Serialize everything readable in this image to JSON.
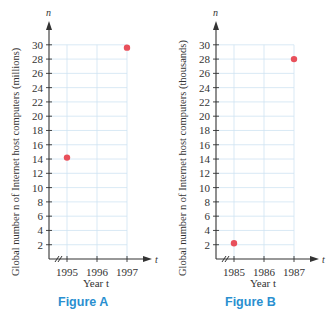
{
  "chart_data": [
    {
      "type": "scatter",
      "title": "Figure A",
      "xlabel": "Year t",
      "ylabel": "Global number n of Internet host computers (millions)",
      "x_axis_symbol": "t",
      "y_axis_symbol": "n",
      "x_ticks": [
        "1995",
        "1996",
        "1997"
      ],
      "y_ticks": [
        2,
        4,
        6,
        8,
        10,
        12,
        14,
        16,
        18,
        20,
        22,
        24,
        26,
        28,
        30
      ],
      "xlim": [
        1994.4,
        1997.5
      ],
      "ylim": [
        0,
        31
      ],
      "axis_break": true,
      "grid": true,
      "points": [
        {
          "x": 1995,
          "y": 14.2
        },
        {
          "x": 1997,
          "y": 29.6
        }
      ],
      "point_color": "#e8505b"
    },
    {
      "type": "scatter",
      "title": "Figure B",
      "xlabel": "Year t",
      "ylabel": "Global number n of Internet host computers (thousands)",
      "x_axis_symbol": "t",
      "y_axis_symbol": "n",
      "x_ticks": [
        "1985",
        "1986",
        "1987"
      ],
      "y_ticks": [
        2,
        4,
        6,
        8,
        10,
        12,
        14,
        16,
        18,
        20,
        22,
        24,
        26,
        28,
        30
      ],
      "xlim": [
        1984.4,
        1987.5
      ],
      "ylim": [
        0,
        31
      ],
      "axis_break": true,
      "grid": true,
      "points": [
        {
          "x": 1985,
          "y": 2.2
        },
        {
          "x": 1987,
          "y": 28
        }
      ],
      "point_color": "#e8505b"
    }
  ],
  "figures": [
    {
      "caption": "Figure A",
      "xlabel": "Year t",
      "ylabel": "Global number n of Internet host computers (millions)",
      "x_symbol": "t",
      "y_symbol": "n",
      "x_ticks": [
        "1995",
        "1996",
        "1997"
      ]
    },
    {
      "caption": "Figure B",
      "xlabel": "Year t",
      "ylabel": "Global number n of Internet host computers (thousands)",
      "x_symbol": "t",
      "y_symbol": "n",
      "x_ticks": [
        "1985",
        "1986",
        "1987"
      ]
    }
  ],
  "colors": {
    "grid": "#cfe3f2",
    "axis": "#333333",
    "point": "#e8505b",
    "caption": "#2a8fd0"
  }
}
